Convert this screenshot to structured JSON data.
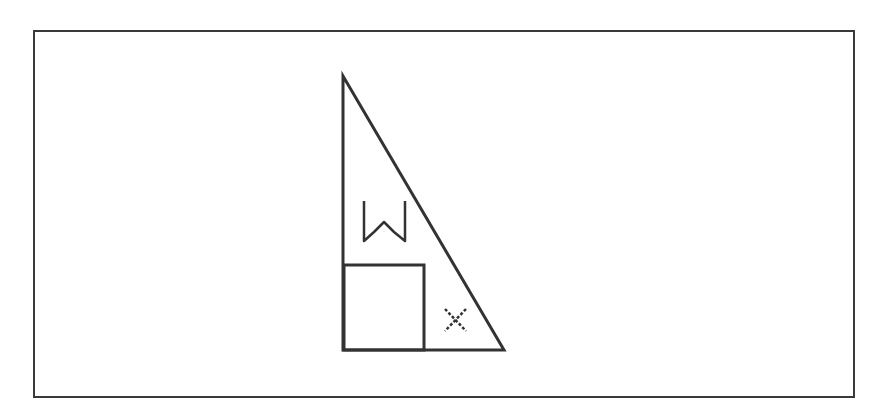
{
  "diagram": {
    "type": "geometry",
    "colors": {
      "stroke": "#333333",
      "background": "#ffffff",
      "frame": "#3a3a3a"
    },
    "triangle": {
      "apex": [
        343,
        76
      ],
      "right_angle": [
        343,
        350
      ],
      "base_end": [
        504,
        350
      ]
    },
    "square": {
      "x": 344,
      "y": 265,
      "width": 80,
      "height": 85
    },
    "labels": [
      {
        "id": "w",
        "text": "W",
        "x": 384,
        "y": 221
      },
      {
        "id": "x",
        "text": "x",
        "x": 455,
        "y": 320
      }
    ]
  }
}
